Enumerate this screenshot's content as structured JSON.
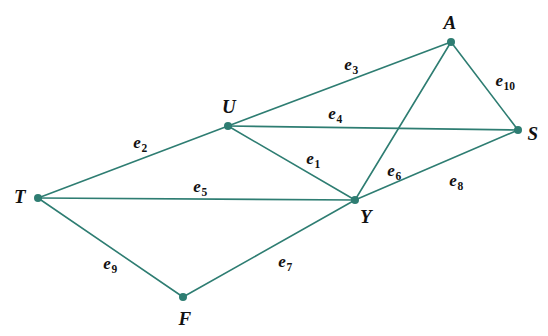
{
  "diagram": {
    "width": 548,
    "height": 336,
    "background_color": "#ffffff",
    "edge_color": "#2e7d72",
    "vertex_color": "#2e7d72",
    "label_color": "#111111",
    "edge_stroke_width": 1.6,
    "vertex_radius": 4
  },
  "vertices": [
    {
      "id": "T",
      "label": "T",
      "x": 38,
      "y": 198,
      "label_x": 20,
      "label_y": 196
    },
    {
      "id": "U",
      "label": "U",
      "x": 228,
      "y": 126,
      "label_x": 229,
      "label_y": 106
    },
    {
      "id": "A",
      "label": "A",
      "x": 451,
      "y": 42,
      "label_x": 450,
      "label_y": 22
    },
    {
      "id": "S",
      "label": "S",
      "x": 518,
      "y": 130,
      "label_x": 533,
      "label_y": 133
    },
    {
      "id": "Y",
      "label": "Y",
      "x": 355,
      "y": 200,
      "label_x": 366,
      "label_y": 216
    },
    {
      "id": "F",
      "label": "F",
      "x": 183,
      "y": 297,
      "label_x": 185,
      "label_y": 318
    }
  ],
  "edges": [
    {
      "id": "e1",
      "base": "e",
      "sub": "1",
      "from": "U",
      "to": "Y",
      "label_x": 313,
      "label_y": 158
    },
    {
      "id": "e2",
      "base": "e",
      "sub": "2",
      "from": "T",
      "to": "U",
      "label_x": 140,
      "label_y": 142
    },
    {
      "id": "e3",
      "base": "e",
      "sub": "3",
      "from": "U",
      "to": "A",
      "label_x": 351,
      "label_y": 64
    },
    {
      "id": "e4",
      "base": "e",
      "sub": "4",
      "from": "U",
      "to": "S",
      "label_x": 335,
      "label_y": 113
    },
    {
      "id": "e5",
      "base": "e",
      "sub": "5",
      "from": "T",
      "to": "Y",
      "label_x": 200,
      "label_y": 186
    },
    {
      "id": "e6",
      "base": "e",
      "sub": "6",
      "from": "A",
      "to": "Y",
      "label_x": 394,
      "label_y": 170
    },
    {
      "id": "e7",
      "base": "e",
      "sub": "7",
      "from": "F",
      "to": "Y",
      "label_x": 285,
      "label_y": 261
    },
    {
      "id": "e8",
      "base": "e",
      "sub": "8",
      "from": "Y",
      "to": "S",
      "label_x": 456,
      "label_y": 180
    },
    {
      "id": "e9",
      "base": "e",
      "sub": "9",
      "from": "T",
      "to": "F",
      "label_x": 110,
      "label_y": 263
    },
    {
      "id": "e10",
      "base": "e",
      "sub": "10",
      "from": "A",
      "to": "S",
      "label_x": 505,
      "label_y": 80
    }
  ]
}
